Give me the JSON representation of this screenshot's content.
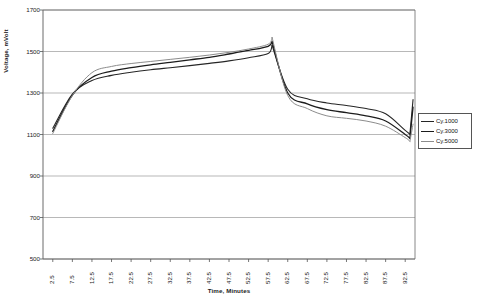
{
  "chart_data": {
    "type": "line",
    "title": "",
    "xlabel": "Time, Minutes",
    "ylabel": "Voltage, mVolt",
    "ylim": [
      500,
      1700
    ],
    "ytick_values": [
      500,
      700,
      900,
      1100,
      1300,
      1500,
      1700
    ],
    "ytick_labels": [
      "500",
      "700",
      "900",
      "1100",
      "1300",
      "1500",
      "1700"
    ],
    "xlim": [
      0,
      95
    ],
    "categories": [
      "2.5",
      "7.5",
      "12.5",
      "17.5",
      "22.5",
      "27.5",
      "32.5",
      "37.5",
      "42.5",
      "47.5",
      "52.5",
      "57.5",
      "62.5",
      "67.5",
      "72.5",
      "77.5",
      "82.5",
      "87.5",
      "92.5"
    ],
    "x": [
      2.5,
      7.5,
      12.5,
      17.5,
      22.5,
      27.5,
      32.5,
      37.5,
      42.5,
      47.5,
      52.5,
      57.5,
      62.5,
      67.5,
      72.5,
      77.5,
      82.5,
      87.5,
      92.5
    ],
    "grid": "horizontal",
    "legend_position": "right",
    "series": [
      {
        "name": "Cy.1000",
        "color": "#262626",
        "width": 1.1,
        "values": [
          1130,
          1295,
          1360,
          1385,
          1400,
          1412,
          1422,
          1432,
          1443,
          1455,
          1470,
          1490,
          1318,
          1272,
          1252,
          1240,
          1225,
          1200,
          1120
        ],
        "peak_value": 1530,
        "peak_x": 58.5,
        "end_value": 1268,
        "end_x": 94.5,
        "min_value": 1120,
        "min_x": 92.5
      },
      {
        "name": "Cy.3000",
        "color": "#1c1c1c",
        "width": 1.3,
        "values": [
          1115,
          1290,
          1375,
          1405,
          1422,
          1436,
          1448,
          1460,
          1472,
          1488,
          1505,
          1525,
          1300,
          1248,
          1220,
          1205,
          1190,
          1165,
          1100
        ],
        "peak_value": 1548,
        "peak_x": 58.5,
        "end_value": 1232,
        "end_x": 94.5,
        "min_value": 1100,
        "min_x": 92.5
      },
      {
        "name": "Cy.5000",
        "color": "#8c8c8c",
        "width": 1.0,
        "values": [
          1105,
          1288,
          1398,
          1428,
          1442,
          1452,
          1462,
          1472,
          1483,
          1496,
          1512,
          1535,
          1288,
          1225,
          1190,
          1178,
          1165,
          1140,
          1085
        ],
        "peak_value": 1568,
        "peak_x": 58.5,
        "end_value": 1150,
        "end_x": 94.5,
        "min_value": 1085,
        "min_x": 92.5
      }
    ]
  },
  "legend": {
    "items": [
      {
        "label": "Cy.1000"
      },
      {
        "label": "Cy.3000"
      },
      {
        "label": "Cy.5000"
      }
    ]
  }
}
